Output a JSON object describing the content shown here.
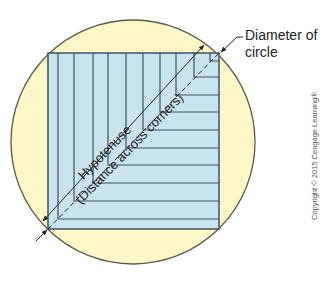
{
  "diagram": {
    "type": "geometry-illustration",
    "colors": {
      "circle_fill": "#fdf7c8",
      "circle_stroke": "#5a5a4a",
      "square_fill": "#c9e4ef",
      "line_color": "#3f5360",
      "text_color": "#222222"
    },
    "circle": {
      "cx": 133,
      "cy": 142,
      "r": 122
    },
    "square": {
      "x": 48,
      "y": 53,
      "size": 171
    },
    "labels": {
      "diameter_line1": "Diameter of",
      "diameter_line2": "circle",
      "hypotenuse": "Hypotenuse",
      "hypotenuse_note": "(Distance across corners)",
      "copyright": "Copyright © 2015 Cengage Learning®."
    }
  }
}
